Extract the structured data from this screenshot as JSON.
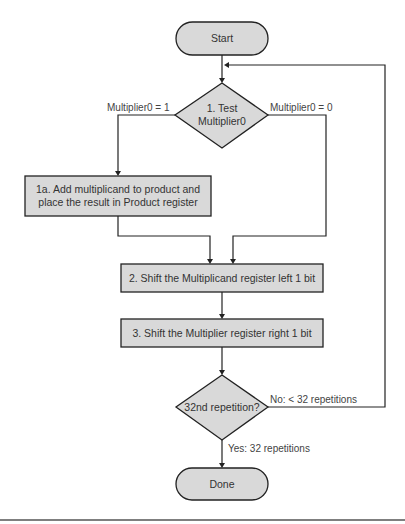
{
  "diagram": {
    "type": "flowchart",
    "nodes": {
      "start": {
        "label": "Start",
        "shape": "terminal"
      },
      "test": {
        "line1": "1. Test",
        "line2": "Multiplier0",
        "shape": "decision"
      },
      "add": {
        "line1": "1a. Add multiplicand to product and",
        "line2": "place the result in Product register",
        "shape": "process"
      },
      "shift_left": {
        "label": "2. Shift the Multiplicand register left 1 bit",
        "shape": "process"
      },
      "shift_right": {
        "label": "3. Shift the Multiplier register right 1 bit",
        "shape": "process"
      },
      "repeat": {
        "label": "32nd repetition?",
        "shape": "decision"
      },
      "done": {
        "label": "Done",
        "shape": "terminal"
      }
    },
    "edges": {
      "multiplier_one": "Multiplier0 = 1",
      "multiplier_zero": "Multiplier0 = 0",
      "no_branch": "No:  < 32 repetitions",
      "yes_branch": "Yes:  32 repetitions"
    },
    "colors": {
      "shape_fill": "#d9d9d9",
      "stroke": "#222222",
      "text": "#333333"
    }
  }
}
